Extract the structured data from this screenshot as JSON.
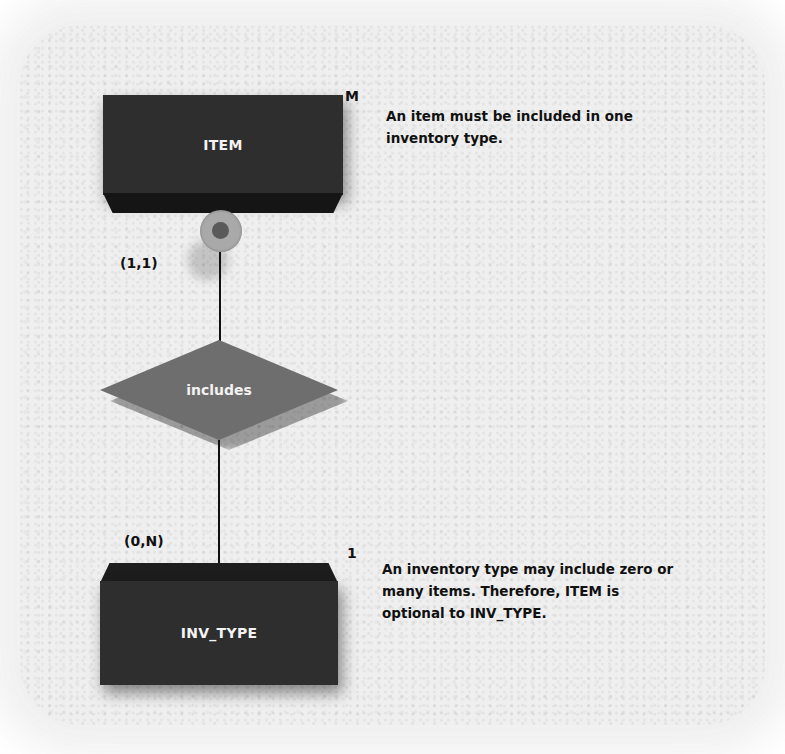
{
  "diagram": {
    "entities": [
      {
        "name": "ITEM",
        "cardinality_label": "M",
        "connectivity": "(1,1)",
        "optional": true
      },
      {
        "name": "INV_TYPE",
        "cardinality_label": "1",
        "connectivity": "(0,N)",
        "optional": false
      }
    ],
    "relationship": {
      "label": "includes"
    },
    "notes": {
      "top": "An item must be included in one inventory type.",
      "bottom": "An inventory type may include zero or many items. Therefore, ITEM is optional to INV_TYPE."
    },
    "colors": {
      "entity_fill": "#2e2e2e",
      "relationship_fill": "#6e6e6e",
      "optional_circle": "#a8a8a8",
      "background": "#efefef"
    }
  }
}
